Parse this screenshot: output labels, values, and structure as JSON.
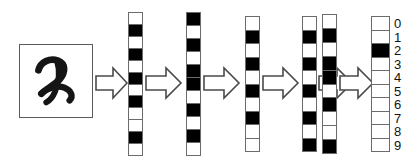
{
  "diagram": {
    "input": {
      "label": "handwritten-digit-2",
      "digit": "2",
      "box_border_color": "#5a5a5a"
    },
    "colors": {
      "active_cell": "#000000",
      "inactive_cell": "#ffffff",
      "cell_border": "#6b6b6b",
      "arrow_stroke": "#4a4a4a",
      "arrow_fill": "#ffffff",
      "background": "#ffffff",
      "text": "#111111"
    },
    "arrows": [
      {
        "name": "arrow-input-to-layer-1"
      },
      {
        "name": "arrow-layer-1-to-layer-2"
      },
      {
        "name": "arrow-layer-2-to-layer-3"
      },
      {
        "name": "arrow-layer-3-to-layer-4"
      },
      {
        "name": "arrow-layer-4-to-layer-5"
      },
      {
        "name": "arrow-layer-5-to-output"
      }
    ],
    "layers": [
      {
        "name": "feature-vector-1",
        "cell_count": 12,
        "cells": [
          0,
          1,
          0,
          1,
          0,
          1,
          0,
          1,
          0,
          0,
          1,
          0
        ]
      },
      {
        "name": "feature-vector-2",
        "cell_count": 11,
        "cells": [
          1,
          0,
          1,
          0,
          1,
          1,
          0,
          1,
          0,
          1,
          0
        ]
      },
      {
        "name": "feature-vector-3",
        "cell_count": 10,
        "cells": [
          0,
          1,
          0,
          1,
          0,
          1,
          0,
          1,
          0,
          0
        ]
      },
      {
        "name": "feature-vector-4",
        "cell_count": 10,
        "cells": [
          0,
          1,
          0,
          1,
          0,
          1,
          0,
          1,
          0,
          1
        ]
      },
      {
        "name": "feature-vector-5",
        "cell_count": 10,
        "cells": [
          0,
          1,
          0,
          1,
          1,
          0,
          1,
          0,
          0,
          1
        ]
      }
    ],
    "output": {
      "name": "class-probability-vector",
      "cell_count": 10,
      "labels": [
        "0",
        "1",
        "2",
        "3",
        "4",
        "5",
        "6",
        "7",
        "8",
        "9"
      ],
      "cells": [
        0,
        0,
        1,
        0,
        0,
        0,
        0,
        0,
        0,
        0
      ],
      "predicted_class": "2"
    }
  }
}
